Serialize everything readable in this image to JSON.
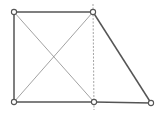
{
  "diagram": {
    "type": "geometric-figure",
    "colors": {
      "background": "#ffffff",
      "edge": "#555555",
      "diagonal": "#8a8a8a",
      "dashed": "#9a9a9a",
      "vertex_fill": "#ffffff",
      "vertex_stroke": "#555555"
    },
    "vertices": [
      {
        "id": "top-left",
        "x": 14,
        "y": 12
      },
      {
        "id": "top-right",
        "x": 93,
        "y": 12
      },
      {
        "id": "bottom-left",
        "x": 14,
        "y": 102
      },
      {
        "id": "bottom-middle",
        "x": 94,
        "y": 102
      },
      {
        "id": "bottom-right",
        "x": 151,
        "y": 103
      }
    ],
    "edges": [
      {
        "id": "top-edge",
        "from": "top-left",
        "to": "top-right",
        "style": "solid"
      },
      {
        "id": "left-edge",
        "from": "top-left",
        "to": "bottom-left",
        "style": "solid"
      },
      {
        "id": "bottom-left-edge",
        "from": "bottom-left",
        "to": "bottom-middle",
        "style": "solid"
      },
      {
        "id": "bottom-right-edge",
        "from": "bottom-middle",
        "to": "bottom-right",
        "style": "solid"
      },
      {
        "id": "slant-edge",
        "from": "top-right",
        "to": "bottom-right",
        "style": "solid"
      },
      {
        "id": "diagonal-1",
        "from": "top-left",
        "to": "bottom-middle",
        "style": "thin"
      },
      {
        "id": "diagonal-2",
        "from": "top-right",
        "to": "bottom-left",
        "style": "thin"
      }
    ],
    "dashed_line": {
      "x1": 93,
      "y1": 4,
      "x2": 94,
      "y2": 110
    }
  }
}
